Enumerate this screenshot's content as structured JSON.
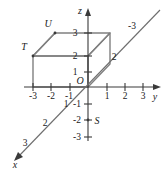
{
  "figure": {
    "type": "3d-coordinate-axes-with-rectangular-box",
    "background_color": "#ffffff",
    "axis_color": "#3a3a3a",
    "box_color": "#808080",
    "label_color": "#1a1a1a"
  },
  "axes": {
    "z": {
      "name": "z",
      "label": "z",
      "direction": "up",
      "arrow": true,
      "tick_labels": [
        "3",
        "2",
        "1",
        "-1",
        "-2",
        "-3"
      ],
      "positive_ticks": [
        "1",
        "2",
        "3"
      ],
      "negative_ticks": [
        "-1",
        "-2",
        "-3"
      ]
    },
    "y": {
      "name": "y",
      "label": "y",
      "direction": "right",
      "arrow": true,
      "tick_labels": [
        "-3",
        "-2",
        "-1",
        "1",
        "2",
        "3"
      ],
      "positive_ticks": [
        "1",
        "2",
        "3"
      ],
      "negative_ticks": [
        "-1",
        "-2",
        "-3"
      ]
    },
    "x": {
      "name": "x",
      "label": "x",
      "direction": "lower-left-diagonal",
      "arrow": true,
      "tick_labels": [
        "1",
        "2",
        "3",
        "-3"
      ],
      "positive_ticks": [
        "1",
        "2",
        "3"
      ],
      "negative_ticks": [
        "-3"
      ],
      "negative_extra_tick": "2"
    }
  },
  "origin": {
    "label": "O"
  },
  "points": [
    {
      "label": "U",
      "position": "top-back-left-corner-of-box"
    },
    {
      "label": "T",
      "position": "top-front-left-corner-of-box"
    },
    {
      "label": "S",
      "position": "on-negative-z-axis-near-minus-2"
    }
  ],
  "box": {
    "name": "rectangular-prism",
    "description": "rectangular box drawn in the octant with negative y, positive z",
    "front_face_corners": [
      "(0,-3,0)",
      "(0,0,0)",
      "(0,0,2)",
      "(0,-3,2)"
    ],
    "top_face_height": "3",
    "front_face_height": "2"
  }
}
